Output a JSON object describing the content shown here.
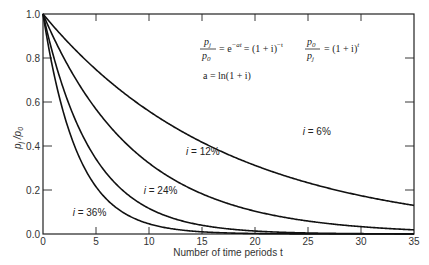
{
  "chart_data": {
    "type": "line",
    "title": "",
    "xlabel": "Number of time periods t",
    "ylabel": "p_j / p_0",
    "xlim": [
      0,
      35
    ],
    "ylim": [
      0.0,
      1.0
    ],
    "x_ticks": [
      0,
      5,
      10,
      15,
      20,
      25,
      30,
      35
    ],
    "x_tick_labels": [
      "0",
      "5",
      "10",
      "15",
      "20",
      "25",
      "30",
      "35"
    ],
    "y_ticks": [
      0.0,
      0.2,
      0.4,
      0.6,
      0.8,
      1.0
    ],
    "y_tick_labels": [
      "0.0",
      "0.2",
      "0.4",
      "0.6",
      "0.8",
      "1.0"
    ],
    "grid": false,
    "function": "p_j/p_0 = (1+i)^(-t)",
    "series": [
      {
        "name": "i = 6%",
        "rate": 0.06,
        "label": "i = 6%",
        "label_at": [
          24.5,
          0.45
        ]
      },
      {
        "name": "i = 12%",
        "rate": 0.12,
        "label": "i = 12%",
        "label_at": [
          13.5,
          0.36
        ]
      },
      {
        "name": "i = 24%",
        "rate": 0.24,
        "label": "i = 24%",
        "label_at": [
          9.5,
          0.18
        ]
      },
      {
        "name": "i = 36%",
        "rate": 0.36,
        "label": "i = 36%",
        "label_at": [
          2.8,
          0.08
        ]
      }
    ],
    "annotations": {
      "eq1_num": "p",
      "eq1_num_sub": "j",
      "eq1_den": "p",
      "eq1_den_sub": "0",
      "eq1_rhs": "= e",
      "eq1_exp": "−at",
      "eq1_rhs2": "= (1 + i)",
      "eq1_exp2": "−t",
      "eq2_num": "p",
      "eq2_num_sub": "0",
      "eq2_den": "p",
      "eq2_den_sub": "j",
      "eq2_rhs": "= (1 + i)",
      "eq2_exp": "t",
      "eq3": "a = ln(1 + i)"
    }
  }
}
